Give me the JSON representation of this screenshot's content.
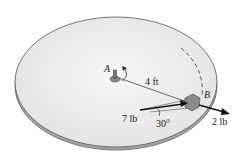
{
  "diagram": {
    "labels": {
      "point_a": "A",
      "point_b": "B",
      "radius": "4 ft",
      "force_large": "7 lb",
      "force_small": "2 lb",
      "angle": "30°"
    },
    "colors": {
      "disk_top": "#ececec",
      "disk_rim": "#9a9a9a",
      "outline": "#555555",
      "arrow": "#111111",
      "block": "#8a8a8a"
    }
  }
}
